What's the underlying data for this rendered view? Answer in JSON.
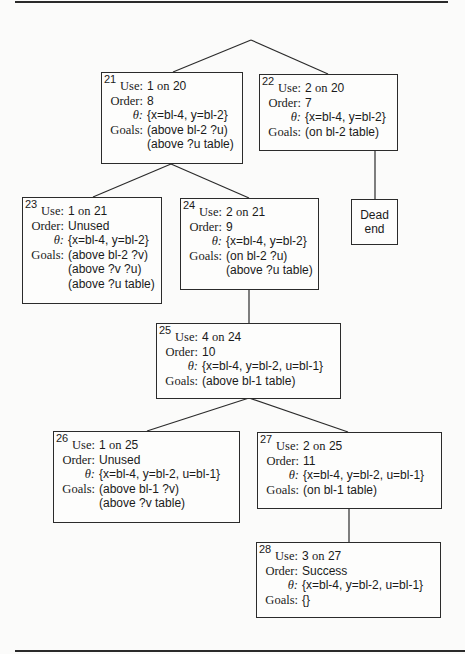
{
  "labels": {
    "use": "Use:",
    "order": "Order:",
    "theta": "θ:",
    "goals": "Goals:",
    "on": "on"
  },
  "nodes": [
    {
      "id": "21",
      "use_num": "1",
      "use_parent": "20",
      "order": "8",
      "theta": "{x=bl-4, y=bl-2}",
      "goals": [
        "(above bl-2 ?u)",
        "(above ?u table)"
      ]
    },
    {
      "id": "22",
      "use_num": "2",
      "use_parent": "20",
      "order": "7",
      "theta": "{x=bl-4, y=bl-2}",
      "goals": [
        "(on bl-2 table)"
      ]
    },
    {
      "id": "23",
      "use_num": "1",
      "use_parent": "21",
      "order": "Unused",
      "theta": "{x=bl-4, y=bl-2}",
      "goals": [
        "(above bl-2 ?v)",
        "(above ?v ?u)",
        "(above ?u table)"
      ]
    },
    {
      "id": "24",
      "use_num": "2",
      "use_parent": "21",
      "order": "9",
      "theta": "{x=bl-4, y=bl-2}",
      "goals": [
        "(on bl-2 ?u)",
        "(above ?u table)"
      ]
    },
    {
      "id": "25",
      "use_num": "4",
      "use_parent": "24",
      "order": "10",
      "theta": "{x=bl-4, y=bl-2, u=bl-1}",
      "goals": [
        "(above bl-1 table)"
      ]
    },
    {
      "id": "26",
      "use_num": "1",
      "use_parent": "25",
      "order": "Unused",
      "theta": "{x=bl-4, y=bl-2, u=bl-1}",
      "goals": [
        "(above bl-1 ?v)",
        "(above ?v table)"
      ]
    },
    {
      "id": "27",
      "use_num": "2",
      "use_parent": "25",
      "order": "11",
      "theta": "{x=bl-4, y=bl-2, u=bl-1}",
      "goals": [
        "(on bl-1 table)"
      ]
    },
    {
      "id": "28",
      "use_num": "3",
      "use_parent": "27",
      "order": "Success",
      "theta": "{x=bl-4, y=bl-2, u=bl-1}",
      "goals": [
        "{}"
      ]
    }
  ],
  "dead_end": {
    "line1": "Dead",
    "line2": "end"
  }
}
